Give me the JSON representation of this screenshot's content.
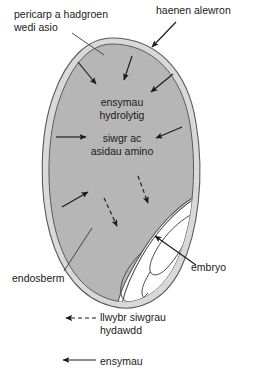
{
  "diagram": {
    "labels": {
      "pericarp": "pericarp a hadgroen\nwedi asio",
      "aleurone": "haenen alewron",
      "endosperm": "endosberm",
      "embryo": "embryo"
    },
    "interior_text": {
      "enzymes": "ensymau\nhydrolytig",
      "sugars": "siwgr ac\nasidau amino"
    },
    "legend": [
      {
        "marker": "dashed-arrow-icon",
        "label": "llwybr siwgrau\nhydawdd"
      },
      {
        "marker": "solid-arrow-icon",
        "label": "ensymau"
      }
    ],
    "colors": {
      "endosperm_fill": "#b6b6b6",
      "coat_fill": "#d9d9d9",
      "embryo_fill": "#ffffff",
      "outline": "#4a4a4a",
      "arrow": "#1a1a1a",
      "text": "#1a1a1a",
      "background": "#ffffff"
    }
  }
}
